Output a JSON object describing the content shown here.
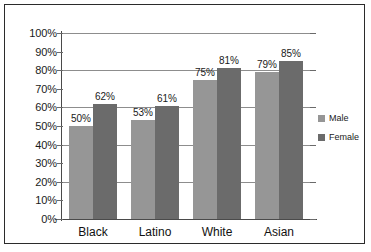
{
  "chart_data": {
    "type": "bar",
    "title": "",
    "subtitle": "",
    "xlabel": "",
    "ylabel": "",
    "categories": [
      "Black",
      "Latino",
      "White",
      "Asian"
    ],
    "series": [
      {
        "name": "Male",
        "color": "#969696",
        "values": [
          50,
          53,
          75,
          79
        ]
      },
      {
        "name": "Female",
        "color": "#6b6b6b",
        "values": [
          62,
          61,
          81,
          85
        ]
      }
    ],
    "value_labels": [
      [
        "50%",
        "53%",
        "75%",
        "79%"
      ],
      [
        "62%",
        "61%",
        "81%",
        "85%"
      ]
    ],
    "ylim": [
      0,
      100
    ],
    "y_ticks": [
      0,
      10,
      20,
      30,
      40,
      50,
      60,
      70,
      80,
      90,
      100
    ],
    "y_tick_labels": [
      "0%",
      "10%",
      "20%",
      "30%",
      "40%",
      "50%",
      "60%",
      "70%",
      "80%",
      "90%",
      "100%"
    ],
    "gridlines": [
      20,
      40,
      60,
      80,
      100
    ],
    "grid": true,
    "legend_position": "right",
    "legend": [
      "Male",
      "Female"
    ]
  },
  "legend": {
    "entries": [
      {
        "label": "Male",
        "color": "#969696"
      },
      {
        "label": "Female",
        "color": "#6b6b6b"
      }
    ]
  },
  "colors": {
    "male_bar": "#969696",
    "female_bar": "#6b6b6b",
    "gridline": "#8d8d8d",
    "axis": "#4a4a4a",
    "frame": "#2b2b2b",
    "text": "#1a1a1a",
    "background": "#ffffff"
  }
}
